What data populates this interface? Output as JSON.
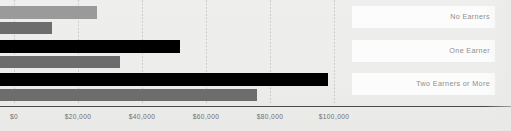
{
  "chart_data": {
    "type": "bar",
    "orientation": "horizontal",
    "title": "",
    "xlabel": "",
    "ylabel": "",
    "categories": [
      "No Earners",
      "One Earner",
      "Two Earners or More"
    ],
    "series": [
      {
        "name": "series-1",
        "color": "#9a9a9a",
        "values": [
          26000,
          52000,
          98000
        ]
      },
      {
        "name": "series-2",
        "color": "#6d6d6d",
        "values": [
          12000,
          33000,
          76000
        ]
      }
    ],
    "series_colors_by_group": [
      [
        "#9a9a9a",
        "#6d6d6d"
      ],
      [
        "#000000",
        "#6d6d6d"
      ],
      [
        "#000000",
        "#6d6d6d"
      ]
    ],
    "xlim": [
      0,
      105000
    ],
    "xticks": [
      0,
      20000,
      40000,
      60000,
      80000,
      100000
    ],
    "xtick_labels": [
      "$0",
      "$20,000",
      "$40,000",
      "$60,000",
      "$80,000",
      "$100,000"
    ],
    "grid": true,
    "grid_style": "dotted-vertical",
    "legend": "right-inline-labels",
    "background_color": "#ededec",
    "axis_color": "#4a4a4a",
    "tick_label_color": "#6f6f6f",
    "category_label_color": "#8d8d8d",
    "label_panel_color": "#fcfcfc"
  },
  "axis": {
    "ticks": [
      {
        "label": "$0",
        "value": 0
      },
      {
        "label": "$20,000",
        "value": 20000
      },
      {
        "label": "$40,000",
        "value": 40000
      },
      {
        "label": "$60,000",
        "value": 60000
      },
      {
        "label": "$80,000",
        "value": 80000
      },
      {
        "label": "$100,000",
        "value": 100000
      }
    ]
  },
  "groups": [
    {
      "label": "No Earners",
      "bars": [
        {
          "value": 26000,
          "color": "#9a9a9a"
        },
        {
          "value": 12000,
          "color": "#6d6d6d"
        }
      ]
    },
    {
      "label": "One Earner",
      "bars": [
        {
          "value": 52000,
          "color": "#000000"
        },
        {
          "value": 33000,
          "color": "#6d6d6d"
        }
      ]
    },
    {
      "label": "Two Earners or More",
      "bars": [
        {
          "value": 98000,
          "color": "#000000"
        },
        {
          "value": 76000,
          "color": "#6d6d6d"
        }
      ]
    }
  ]
}
